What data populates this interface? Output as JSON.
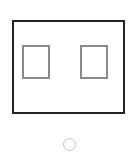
{
  "diagram": {
    "shapes": [
      {
        "id": "outer-frame",
        "type": "rectangle",
        "stroke": "#222222"
      },
      {
        "id": "left-window",
        "type": "rectangle",
        "stroke": "#8a8a8a"
      },
      {
        "id": "right-window",
        "type": "rectangle",
        "stroke": "#8a8a8a"
      },
      {
        "id": "home-circle",
        "type": "circle",
        "stroke": "#c4c4c4"
      }
    ]
  }
}
